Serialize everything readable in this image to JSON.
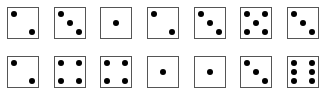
{
  "rows": [
    {
      "values": [
        2,
        3,
        1,
        2,
        3,
        5,
        3
      ]
    },
    {
      "values": [
        2,
        4,
        4,
        1,
        1,
        3,
        6
      ]
    }
  ],
  "layout": {
    "x": [
      7,
      54,
      100,
      147,
      194,
      240,
      287
    ],
    "y": [
      7,
      56
    ]
  },
  "colors": {
    "pip": "#000000",
    "border": "#555555",
    "face": "#ffffff"
  }
}
